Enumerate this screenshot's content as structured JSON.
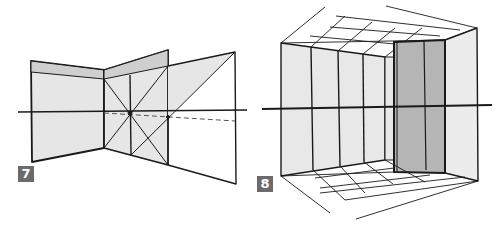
{
  "figures": [
    {
      "label": "7",
      "description": "Two-point style perspective: folded panels with diagonals meeting at vanishing point on horizon line",
      "colors": {
        "panel_fill": "#e6e6e6",
        "band_fill": "#cfcfcf",
        "line": "#1a1a1a",
        "dashed": "#555555"
      }
    },
    {
      "label": "8",
      "description": "One-point perspective room interior with wall panels, ceiling and floor grid, and a darker shaded panel",
      "colors": {
        "wall_fill": "#e8e8e8",
        "dark_panel_fill": "#b5b5b5",
        "line": "#1a1a1a"
      }
    }
  ],
  "badge_color": "#6b6b6b"
}
